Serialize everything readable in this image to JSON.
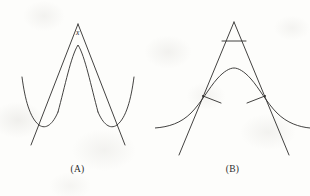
{
  "figure": {
    "background_color": "#fdfdfb",
    "stroke_color": "#2e2c2b",
    "panels": [
      {
        "id": "A",
        "caption": "(A)",
        "angle_label": "x",
        "description": "Curve with a rounded minimum on each side and a rounded peak at center, crossed by two straight lines that meet above the peak forming a sharp V apex with labeled angle x"
      },
      {
        "id": "B",
        "caption": "(B)",
        "angle_label": "x",
        "description": "Bell-shaped curve with two tangent lines touching at the inflection points, extending upward to meet at an apex above the peak; a horizontal crossbar near the apex encloses the labeled angle x; small tick marks at the tangency points"
      }
    ]
  }
}
